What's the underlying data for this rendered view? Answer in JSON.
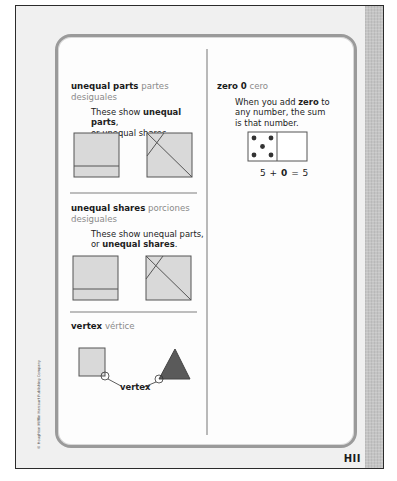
{
  "page": {
    "number": "HII",
    "copyright": "© Houghton Mifflin Harcourt Publishing Company"
  },
  "left_column": {
    "entries": [
      {
        "term": "unequal parts",
        "spanish_first": "partes",
        "spanish_second": "desiguales",
        "desc_pre": "These show ",
        "desc_bold": "unequal parts",
        "desc_post": ",",
        "desc_line2": "or unequal shares.",
        "figures": [
          "square-with-horizontal-line",
          "square-with-diagonal-lines"
        ]
      },
      {
        "term": "unequal shares",
        "spanish_first": "porciones",
        "spanish_second": "desiguales",
        "desc_line1": "These show unequal parts,",
        "desc_pre2": "or ",
        "desc_bold2": "unequal shares",
        "desc_post2": ".",
        "figures": [
          "square-with-horizontal-line",
          "square-with-diagonal-lines"
        ]
      },
      {
        "term": "vertex",
        "spanish": "vértice",
        "label": "vertex",
        "figures": [
          "square",
          "triangle"
        ]
      }
    ]
  },
  "right_column": {
    "entry": {
      "term": "zero",
      "symbol": "0",
      "spanish": "cero",
      "desc_pre": "When you add ",
      "desc_bold": "zero",
      "desc_post": " to",
      "desc_line2": "any number, the sum",
      "desc_line3": "is that number.",
      "domino": {
        "left_dots": 5,
        "right_dots": 0
      },
      "equation": {
        "a": "5",
        "plus": "+",
        "b": "0",
        "equals": "=",
        "result": "5"
      }
    }
  },
  "colors": {
    "shape_fill": "#d9d9d9",
    "triangle_fill": "#5a5a5a",
    "spanish_text": "#8a8a8a",
    "card_border": "#9a9a9a"
  }
}
